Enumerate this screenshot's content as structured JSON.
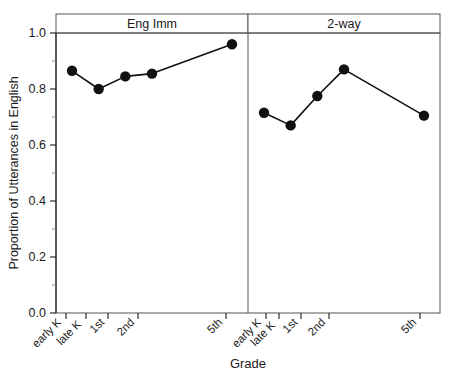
{
  "chart_data": {
    "type": "line",
    "title": "",
    "xlabel": "Grade",
    "ylabel": "Proportion of Utterances in English",
    "ylim": [
      0.0,
      1.0
    ],
    "ytick_labels": [
      "0.0",
      "0.2",
      "0.4",
      "0.6",
      "0.8",
      "1.0"
    ],
    "ytick_values": [
      0.0,
      0.2,
      0.4,
      0.6,
      0.8,
      1.0
    ],
    "yminor_values": [
      0.1,
      0.3,
      0.5,
      0.7,
      0.9
    ],
    "grid": false,
    "legend_position": "none",
    "categories": [
      "early K",
      "late K",
      "1st",
      "2nd",
      "5th"
    ],
    "category_positions": [
      1,
      2,
      3,
      4,
      7
    ],
    "xlim": [
      0.4,
      7.6
    ],
    "panels": [
      {
        "label": "Eng Imm",
        "series": [
          {
            "name": "Eng Imm",
            "categories": [
              "early K",
              "late K",
              "1st",
              "2nd",
              "5th"
            ],
            "values": [
              0.865,
              0.8,
              0.845,
              0.855,
              0.96
            ]
          }
        ]
      },
      {
        "label": "2-way",
        "series": [
          {
            "name": "2-way",
            "categories": [
              "early K",
              "late K",
              "1st",
              "2nd",
              "5th"
            ],
            "values": [
              0.715,
              0.67,
              0.775,
              0.87,
              0.705
            ]
          }
        ]
      }
    ]
  },
  "axis": {
    "y_title": "Proportion of Utterances in English",
    "x_title": "Grade"
  }
}
